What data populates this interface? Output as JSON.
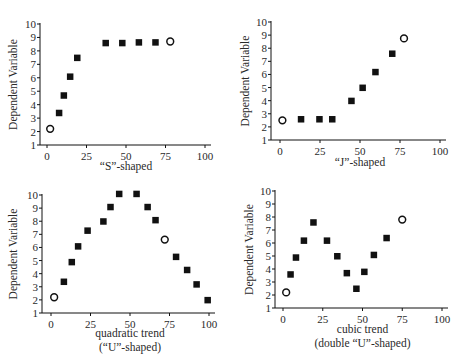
{
  "chart_data": [
    {
      "type": "scatter",
      "title": "",
      "xlabel": "“S”-shaped",
      "xlabel_line2": "",
      "ylabel": "Dependent Variable",
      "xlim": [
        0,
        100
      ],
      "ylim": [
        1,
        10
      ],
      "xticks": [
        0,
        25,
        50,
        75,
        100
      ],
      "yticks": [
        1,
        2,
        3,
        4,
        5,
        6,
        7,
        8,
        9,
        10
      ],
      "grid": false,
      "legend": null,
      "series": [
        {
          "name": "filled",
          "marker": "square",
          "x": [
            7.5,
            10.5,
            14.5,
            19,
            37,
            47.5,
            58,
            68.5
          ],
          "y": [
            3.4,
            4.7,
            6.1,
            7.5,
            8.6,
            8.6,
            8.65,
            8.65
          ]
        },
        {
          "name": "open",
          "marker": "circle",
          "x": [
            2,
            78
          ],
          "y": [
            2.2,
            8.7
          ]
        }
      ]
    },
    {
      "type": "scatter",
      "title": "",
      "xlabel": "“J”-shaped",
      "xlabel_line2": "",
      "ylabel": "Dependent Variable",
      "xlim": [
        0,
        100
      ],
      "ylim": [
        1,
        10
      ],
      "xticks": [
        0,
        25,
        50,
        75,
        100
      ],
      "yticks": [
        1,
        2,
        3,
        4,
        5,
        6,
        7,
        8,
        9,
        10
      ],
      "grid": false,
      "legend": null,
      "series": [
        {
          "name": "filled",
          "marker": "square",
          "x": [
            13,
            24.5,
            32.5,
            44.5,
            51.5,
            59.5,
            70
          ],
          "y": [
            2.6,
            2.6,
            2.6,
            4.0,
            5.0,
            6.2,
            7.6
          ]
        },
        {
          "name": "open",
          "marker": "circle",
          "x": [
            1.5,
            77.5
          ],
          "y": [
            2.5,
            8.75
          ]
        }
      ]
    },
    {
      "type": "scatter",
      "title": "",
      "xlabel": "quadratic trend",
      "xlabel_line2": "(“U”-shaped)",
      "ylabel": "Dependent Variable",
      "xlim": [
        0,
        100
      ],
      "ylim": [
        1,
        10
      ],
      "xticks": [
        0,
        25,
        50,
        75,
        100
      ],
      "yticks": [
        1,
        2,
        3,
        4,
        5,
        6,
        7,
        8,
        9,
        10
      ],
      "grid": false,
      "legend": null,
      "series": [
        {
          "name": "filled",
          "marker": "square",
          "x": [
            8,
            13,
            17,
            23,
            33,
            37.5,
            43,
            54,
            61,
            66,
            79,
            86,
            92,
            99
          ],
          "y": [
            3.4,
            4.9,
            6.1,
            7.3,
            8.0,
            9.1,
            10.1,
            10.1,
            9.1,
            8.1,
            5.3,
            4.3,
            3.2,
            2.0
          ]
        },
        {
          "name": "open",
          "marker": "circle",
          "x": [
            2,
            72
          ],
          "y": [
            2.2,
            6.6
          ]
        }
      ]
    },
    {
      "type": "scatter",
      "title": "",
      "xlabel": "cubic trend",
      "xlabel_line2": "(double “U”-shaped)",
      "ylabel": "Dependent Variable",
      "xlim": [
        0,
        100
      ],
      "ylim": [
        1,
        10
      ],
      "xticks": [
        0,
        25,
        50,
        75,
        100
      ],
      "yticks": [
        1,
        2,
        3,
        4,
        5,
        6,
        7,
        8,
        9,
        10
      ],
      "grid": false,
      "legend": null,
      "series": [
        {
          "name": "filled",
          "marker": "square",
          "x": [
            4.6,
            8,
            13,
            19,
            27.5,
            34,
            40,
            46,
            51,
            57,
            65
          ],
          "y": [
            3.6,
            4.9,
            6.2,
            7.6,
            6.2,
            5.0,
            3.7,
            2.5,
            3.8,
            5.1,
            6.4
          ]
        },
        {
          "name": "open",
          "marker": "circle",
          "x": [
            2,
            75
          ],
          "y": [
            2.2,
            7.8
          ]
        }
      ]
    }
  ],
  "layout": {
    "panels": [
      {
        "id": "s-shaped",
        "axis_x": 40,
        "axis_y": 145,
        "x0": 47,
        "x100": 205,
        "y1": 145,
        "y10": 24,
        "ylabel_cx": 14,
        "xlabel_y": 170
      },
      {
        "id": "j-shaped",
        "axis_x": 271,
        "axis_y": 140,
        "x0": 280,
        "x100": 440,
        "y1": 140,
        "y10": 22,
        "ylabel_cx": 246,
        "xlabel_y": 166
      },
      {
        "id": "quadratic",
        "axis_x": 42,
        "axis_y": 313,
        "x0": 51,
        "x100": 209,
        "y1": 313,
        "y10": 195,
        "ylabel_cx": 14,
        "xlabel_y": 337
      },
      {
        "id": "cubic",
        "axis_x": 275,
        "axis_y": 308,
        "x0": 283,
        "x100": 442,
        "y1": 308,
        "y10": 191,
        "ylabel_cx": 250,
        "xlabel_y": 333
      }
    ],
    "ink_color": "#111111"
  }
}
